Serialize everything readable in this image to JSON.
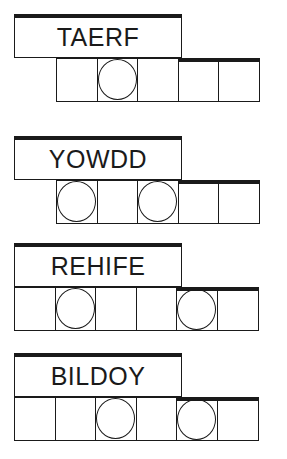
{
  "puzzle_type": "jumble",
  "colors": {
    "ink": "#1a1a1a",
    "background": "#ffffff"
  },
  "words": [
    {
      "scrambled": "TAERF",
      "cell_count": 5,
      "circled_positions": [
        2
      ],
      "cells_offset_left": 56
    },
    {
      "scrambled": "YOWDD",
      "cell_count": 5,
      "circled_positions": [
        1,
        3
      ],
      "cells_offset_left": 56
    },
    {
      "scrambled": "REHIFE",
      "cell_count": 6,
      "circled_positions": [
        2,
        5
      ],
      "cells_offset_left": 14
    },
    {
      "scrambled": "BILDOY",
      "cell_count": 6,
      "circled_positions": [
        3,
        5
      ],
      "cells_offset_left": 14
    }
  ]
}
